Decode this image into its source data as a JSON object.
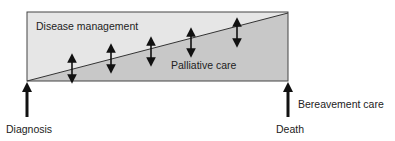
{
  "diagram": {
    "regions": {
      "upper_label": "Disease management",
      "lower_label": "Palliative care"
    },
    "markers": {
      "start_label": "Diagnosis",
      "end_label": "Death",
      "after_label": "Bereavement care"
    },
    "double_arrows_count": 5,
    "colors": {
      "upper_fill": "#e6e6e6",
      "lower_fill": "#c8c8c8",
      "stroke": "#333333",
      "arrow": "#111111"
    }
  }
}
